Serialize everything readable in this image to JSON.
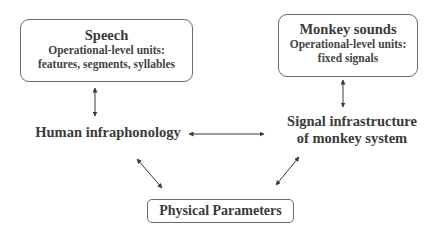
{
  "nodes": {
    "speech": {
      "title": "Speech",
      "line1": "Operational-level units:",
      "line2": "features, segments, syllables"
    },
    "monkey_sounds": {
      "title": "Monkey sounds",
      "line1": "Operational-level units:",
      "line2": "fixed signals"
    },
    "human_infraphonology": {
      "label": "Human infraphonology"
    },
    "signal_infrastructure": {
      "line1": "Signal infrastructure",
      "line2": "of monkey system"
    },
    "physical_parameters": {
      "label": "Physical Parameters"
    }
  },
  "edges": [
    {
      "from": "speech",
      "to": "human_infraphonology",
      "type": "bidirectional"
    },
    {
      "from": "monkey_sounds",
      "to": "signal_infrastructure",
      "type": "bidirectional"
    },
    {
      "from": "human_infraphonology",
      "to": "signal_infrastructure",
      "type": "bidirectional"
    },
    {
      "from": "human_infraphonology",
      "to": "physical_parameters",
      "type": "bidirectional"
    },
    {
      "from": "signal_infrastructure",
      "to": "physical_parameters",
      "type": "bidirectional"
    }
  ]
}
